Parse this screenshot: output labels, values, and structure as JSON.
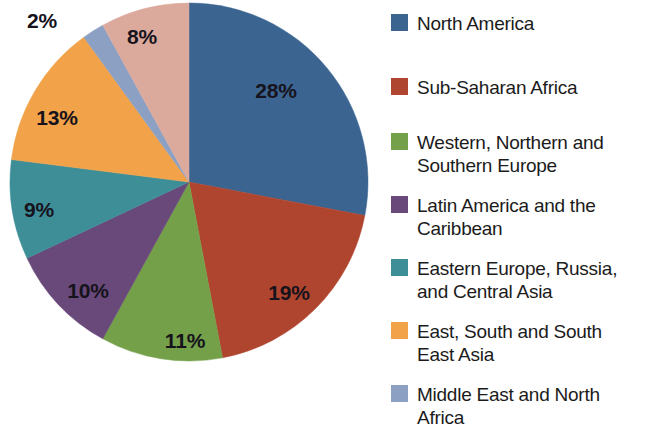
{
  "chart_data": {
    "type": "pie",
    "title": "",
    "subtitle": "",
    "xlabel": "",
    "ylabel": "",
    "legend_position": "right",
    "grid": false,
    "start_angle_deg": 0,
    "direction": "clockwise",
    "categories": [
      "North America",
      "Sub-Saharan Africa",
      "Western, Northern and Southern Europe",
      "Latin America and the Caribbean",
      "Eastern Europe, Russia, and Central Asia",
      "East, South and South East Asia",
      "Middle East and North Africa",
      "Other"
    ],
    "values": [
      28,
      19,
      11,
      10,
      9,
      13,
      2,
      8
    ],
    "data_labels": [
      "28%",
      "19%",
      "11%",
      "10%",
      "9%",
      "13%",
      "2%",
      "8%"
    ],
    "colors": [
      "#3b6491",
      "#b0452f",
      "#74a04a",
      "#69497a",
      "#3e8e98",
      "#f2a248",
      "#8ca0c4",
      "#dcaa9c"
    ],
    "units": "percent",
    "total": 100
  },
  "pie": {
    "center_x": 189,
    "center_y": 182,
    "radius": 179,
    "slices": [
      {
        "name": "north-america",
        "label": "28%",
        "value": 28,
        "color": "#3b6491",
        "start": 0,
        "sweep": 100.8,
        "label_x": 276,
        "label_y": 90,
        "label_visible": true
      },
      {
        "name": "sub-saharan-africa",
        "label": "19%",
        "value": 19,
        "color": "#b0452f",
        "start": 100.8,
        "sweep": 68.4,
        "label_x": 289,
        "label_y": 292,
        "label_visible": true
      },
      {
        "name": "western-northern-southern-europe",
        "label": "11%",
        "value": 11,
        "color": "#74a04a",
        "start": 169.2,
        "sweep": 39.6,
        "label_x": 185,
        "label_y": 340,
        "label_visible": true
      },
      {
        "name": "latin-america-caribbean",
        "label": "10%",
        "value": 10,
        "color": "#69497a",
        "start": 208.8,
        "sweep": 36,
        "label_x": 88,
        "label_y": 290,
        "label_visible": true
      },
      {
        "name": "eastern-europe-russia-central-asia",
        "label": "9%",
        "value": 9,
        "color": "#3e8e98",
        "start": 244.8,
        "sweep": 32.4,
        "label_x": 39,
        "label_y": 209,
        "label_visible": true
      },
      {
        "name": "east-south-southeast-asia",
        "label": "13%",
        "value": 13,
        "color": "#f2a248",
        "start": 277.2,
        "sweep": 46.8,
        "label_x": 57,
        "label_y": 117,
        "label_visible": true
      },
      {
        "name": "middle-east-north-africa",
        "label": "2%",
        "value": 2,
        "color": "#8ca0c4",
        "start": 324,
        "sweep": 7.2,
        "label_x": 42,
        "label_y": 20,
        "label_visible": true
      },
      {
        "name": "other",
        "label": "8%",
        "value": 8,
        "color": "#dcaa9c",
        "start": 331.2,
        "sweep": 28.8,
        "label_x": 142,
        "label_y": 36,
        "label_visible": true
      }
    ]
  },
  "legend": {
    "items": [
      {
        "label": "North America",
        "color": "#3b6491",
        "top": 8,
        "name": "north-america"
      },
      {
        "label": "Sub-Saharan Africa",
        "color": "#b0452f",
        "top": 72,
        "name": "sub-saharan-africa"
      },
      {
        "label": "Western, Northern and\nSouthern Europe",
        "color": "#74a04a",
        "top": 127,
        "name": "western-northern-southern-europe"
      },
      {
        "label": "Latin America and the\nCaribbean",
        "color": "#69497a",
        "top": 190,
        "name": "latin-america-caribbean"
      },
      {
        "label": "Eastern Europe, Russia,\nand Central Asia",
        "color": "#3e8e98",
        "top": 253,
        "name": "eastern-europe-russia-central-asia"
      },
      {
        "label": "East, South and South\nEast Asia",
        "color": "#f2a248",
        "top": 316,
        "name": "east-south-southeast-asia"
      },
      {
        "label": "Middle East and North\nAfrica",
        "color": "#8ca0c4",
        "top": 379,
        "name": "middle-east-north-africa"
      }
    ]
  }
}
